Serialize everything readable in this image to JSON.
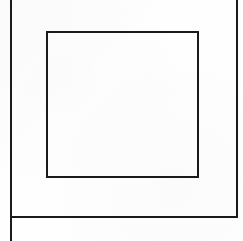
{
  "figure": {
    "type": "line-drawing",
    "canvas": {
      "width": 243,
      "height": 241,
      "background_color": "#fefefe",
      "ink_color": "#1a1a1a"
    },
    "shapes": [
      {
        "name": "outer-frame-left-edge",
        "kind": "line",
        "x1": 10.5,
        "y1": 0,
        "x2": 10.5,
        "y2": 241,
        "stroke_width": 2.0,
        "color": "#1a1a1a"
      },
      {
        "name": "outer-frame-right-edge",
        "kind": "line",
        "x1": 236.5,
        "y1": 0,
        "x2": 236.5,
        "y2": 217,
        "stroke_width": 2.0,
        "color": "#1a1a1a"
      },
      {
        "name": "outer-frame-bottom-edge",
        "kind": "line",
        "x1": 9.5,
        "y1": 216.5,
        "x2": 237.5,
        "y2": 216.5,
        "stroke_width": 2.0,
        "color": "#1a1a1a"
      },
      {
        "name": "inner-rectangle",
        "kind": "rect",
        "x": 47,
        "y": 32,
        "width": 151,
        "height": 145,
        "stroke_width": 2.0,
        "color": "#1a1a1a",
        "fill": "none"
      }
    ]
  }
}
